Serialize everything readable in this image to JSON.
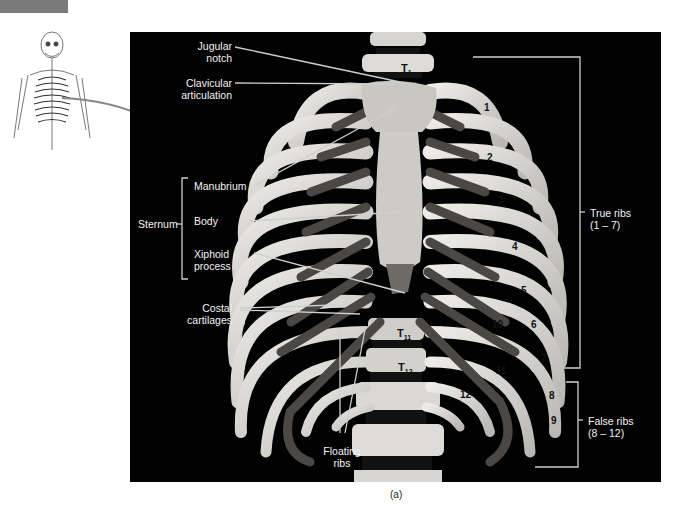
{
  "figure": {
    "caption": "(a)",
    "thumbnail": {
      "name": "full-skeleton-thumbnail",
      "highlighted_region": "thoracic cage"
    },
    "labels": {
      "jugular_notch": "Jugular notch",
      "jugular_notch_l1": "Jugular",
      "jugular_notch_l2": "notch",
      "clavicular_l1": "Clavicular",
      "clavicular_l2": "articulation",
      "manubrium": "Manubrium",
      "body": "Body",
      "xiphoid_l1": "Xiphoid",
      "xiphoid_l2": "process",
      "sternum": "Sternum",
      "costal_l1": "Costal",
      "costal_l2": "cartilages",
      "floating_l1": "Floating",
      "floating_l2": "ribs",
      "true_ribs_l1": "True ribs",
      "true_ribs_l2": "(1 – 7)",
      "false_ribs_l1": "False ribs",
      "false_ribs_l2": "(8 – 12)"
    },
    "vertebrae": {
      "t1": "T",
      "t1_sub": "1",
      "t11": "T",
      "t11_sub": "11",
      "t12": "T",
      "t12_sub": "12"
    },
    "rib_numbers": [
      "1",
      "2",
      "3",
      "4",
      "5",
      "6",
      "7",
      "8",
      "9",
      "10",
      "11",
      "12"
    ],
    "colors": {
      "background": "#020202",
      "bone": "#d9d9d6",
      "cartilage": "#4a4744",
      "label_text": "#f2f2f2",
      "leader_line": "#cfcfcf"
    }
  }
}
